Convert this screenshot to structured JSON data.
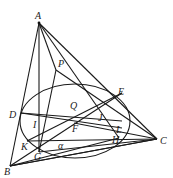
{
  "diagram": {
    "type": "geometry",
    "points": {
      "A": {
        "label": "A",
        "x": 39,
        "y": 23
      },
      "B": {
        "label": "B",
        "x": 10,
        "y": 165
      },
      "C": {
        "label": "C",
        "x": 156,
        "y": 139
      },
      "P": {
        "label": "P",
        "x": 56,
        "y": 68
      },
      "Q": {
        "label": "Q",
        "x": 73,
        "y": 108
      },
      "E": {
        "label": "E",
        "x": 122,
        "y": 94
      },
      "D": {
        "label": "D",
        "x": 21,
        "y": 116
      },
      "I": {
        "label": "I",
        "x": 38,
        "y": 126
      },
      "F": {
        "label": "F",
        "x": 74,
        "y": 122
      },
      "J": {
        "label": "J",
        "x": 106,
        "y": 116
      },
      "L": {
        "label": "L",
        "x": 122,
        "y": 127
      },
      "K": {
        "label": "K",
        "x": 27,
        "y": 143
      },
      "G": {
        "label": "G",
        "x": 39,
        "y": 152
      },
      "H": {
        "label": "H",
        "x": 119,
        "y": 138
      },
      "alpha": {
        "label": "α",
        "x": 59,
        "y": 146
      }
    },
    "ellipse": {
      "cx": 75,
      "cy": 121,
      "rx": 55,
      "ry": 37,
      "name": "α"
    }
  }
}
